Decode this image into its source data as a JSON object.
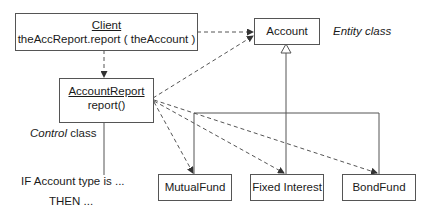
{
  "diagram": {
    "classes": {
      "client": {
        "name": "Client",
        "operation": "theAccReport.report ( theAccount )"
      },
      "account_report": {
        "name": "AccountReport",
        "operation": "report()"
      },
      "account": {
        "name": "Account"
      },
      "mutual_fund": {
        "name": "MutualFund"
      },
      "fixed_interest": {
        "name": "Fixed Interest"
      },
      "bond_fund": {
        "name": "BondFund"
      }
    },
    "annotations": {
      "entity_class": "Entity class",
      "control_italic": "Control",
      "control_rest": " class",
      "if_line": "IF Account type is ...",
      "then_line": "THEN ..."
    },
    "relationships": [
      {
        "from": "Client",
        "to": "AccountReport",
        "type": "dependency"
      },
      {
        "from": "Client",
        "to": "Account",
        "type": "dependency"
      },
      {
        "from": "AccountReport",
        "to": "Account",
        "type": "dependency"
      },
      {
        "from": "AccountReport",
        "to": "MutualFund",
        "type": "dependency"
      },
      {
        "from": "AccountReport",
        "to": "Fixed Interest",
        "type": "dependency"
      },
      {
        "from": "AccountReport",
        "to": "BondFund",
        "type": "dependency"
      },
      {
        "from": "MutualFund",
        "to": "Account",
        "type": "generalization"
      },
      {
        "from": "Fixed Interest",
        "to": "Account",
        "type": "generalization"
      },
      {
        "from": "BondFund",
        "to": "Account",
        "type": "generalization"
      }
    ],
    "colors": {
      "line": "#555555",
      "text": "#1a1a1a",
      "background": "#ffffff"
    }
  }
}
